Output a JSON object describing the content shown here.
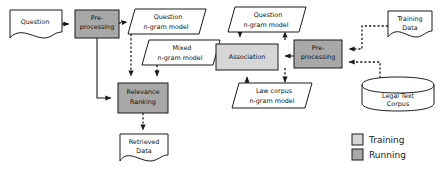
{
  "diagram": {
    "colors": {
      "training_fill": "#d6d6d6",
      "running_fill": "#a8a8a8",
      "plain_fill": "#ffffff",
      "stroke": "#1a1a1a",
      "background": "#ffffff"
    },
    "nodes": [
      {
        "id": "question",
        "label_line1": "Question",
        "label_line2": "",
        "shape": "document",
        "fill": "plain",
        "x": 10,
        "y": 10,
        "w": 52,
        "h": 28
      },
      {
        "id": "preprocessing-left",
        "label_line1": "Pre-",
        "label_line2": "processing",
        "shape": "rect",
        "fill": "running",
        "x": 75,
        "y": 10,
        "w": 44,
        "h": 28
      },
      {
        "id": "question-ngram-left",
        "label_line1": "Question",
        "label_line2": "n-gram model",
        "shape": "parallelogram",
        "fill": "plain",
        "x": 128,
        "y": 9,
        "w": 78,
        "h": 25
      },
      {
        "id": "mixed-ngram",
        "label_line1": "Mixed",
        "label_line2": "n-gram model",
        "shape": "parallelogram",
        "fill": "plain",
        "x": 142,
        "y": 40,
        "w": 78,
        "h": 25
      },
      {
        "id": "relevance-ranking",
        "label_line1": "Relevance",
        "label_line2": "Ranking",
        "shape": "rect",
        "fill": "running",
        "x": 118,
        "y": 83,
        "w": 50,
        "h": 30
      },
      {
        "id": "retrieved-data",
        "label_line1": "Retrieved",
        "label_line2": "Data",
        "shape": "document",
        "fill": "plain",
        "x": 118,
        "y": 131,
        "w": 50,
        "h": 30
      },
      {
        "id": "question-ngram-right",
        "label_line1": "Question",
        "label_line2": "n-gram model",
        "shape": "parallelogram",
        "fill": "plain",
        "x": 228,
        "y": 7,
        "w": 78,
        "h": 25
      },
      {
        "id": "association",
        "label_line1": "Association",
        "label_line2": "",
        "shape": "rect",
        "fill": "training",
        "x": 216,
        "y": 44,
        "w": 62,
        "h": 26
      },
      {
        "id": "law-corpus-ngram",
        "label_line1": "Law corpus",
        "label_line2": "n-gram model",
        "shape": "parallelogram",
        "fill": "plain",
        "x": 232,
        "y": 83,
        "w": 80,
        "h": 25
      },
      {
        "id": "preprocessing-right",
        "label_line1": "Pre-",
        "label_line2": "processing",
        "shape": "rect",
        "fill": "running",
        "x": 294,
        "y": 40,
        "w": 48,
        "h": 28
      },
      {
        "id": "training-data",
        "label_line1": "Training",
        "label_line2": "Data",
        "shape": "document",
        "fill": "plain",
        "x": 388,
        "y": 9,
        "w": 44,
        "h": 28
      },
      {
        "id": "legal-text-corpus",
        "label_line1": "Legal Text",
        "label_line2": "Corpus",
        "shape": "cylinder",
        "fill": "plain",
        "x": 362,
        "y": 78,
        "w": 72,
        "h": 32
      }
    ],
    "edges": [
      {
        "id": "question-to-preprocessing-left",
        "from": "question",
        "to": "preprocessing-left",
        "style": "dashed"
      },
      {
        "id": "preprocessing-left-to-question-ngram",
        "from": "preprocessing-left",
        "to": "question-ngram-left",
        "style": "dashed"
      },
      {
        "id": "preprocessing-left-to-relevance",
        "from": "preprocessing-left",
        "to": "relevance-ranking",
        "style": "solid"
      },
      {
        "id": "question-ngram-left-to-relevance",
        "from": "question-ngram-left",
        "to": "relevance-ranking",
        "style": "dashed"
      },
      {
        "id": "mixed-ngram-to-relevance",
        "from": "mixed-ngram",
        "to": "relevance-ranking",
        "style": "dashed"
      },
      {
        "id": "relevance-to-retrieved-data",
        "from": "relevance-ranking",
        "to": "retrieved-data",
        "style": "dashed"
      },
      {
        "id": "association-to-mixed-ngram",
        "from": "association",
        "to": "mixed-ngram",
        "style": "dashed"
      },
      {
        "id": "question-ngram-right-to-association",
        "from": "question-ngram-right",
        "to": "association",
        "style": "dashed"
      },
      {
        "id": "law-corpus-ngram-to-association",
        "from": "law-corpus-ngram",
        "to": "association",
        "style": "dashed"
      },
      {
        "id": "preprocessing-right-to-association",
        "from": "preprocessing-right",
        "to": "association",
        "style": "solid"
      },
      {
        "id": "preprocessing-right-to-question-ngram",
        "from": "preprocessing-right",
        "to": "question-ngram-right",
        "style": "dashed"
      },
      {
        "id": "preprocessing-right-to-law-corpus",
        "from": "preprocessing-right",
        "to": "law-corpus-ngram",
        "style": "dashed"
      },
      {
        "id": "training-data-to-preprocessing-right",
        "from": "training-data",
        "to": "preprocessing-right",
        "style": "dashed"
      },
      {
        "id": "legal-text-corpus-to-preprocessing",
        "from": "legal-text-corpus",
        "to": "preprocessing-right",
        "style": "dashed"
      }
    ],
    "legend": {
      "items": [
        {
          "id": "legend-training",
          "label": "Training",
          "fill": "#d6d6d6"
        },
        {
          "id": "legend-running",
          "label": "Running",
          "fill": "#a8a8a8"
        }
      ]
    }
  }
}
